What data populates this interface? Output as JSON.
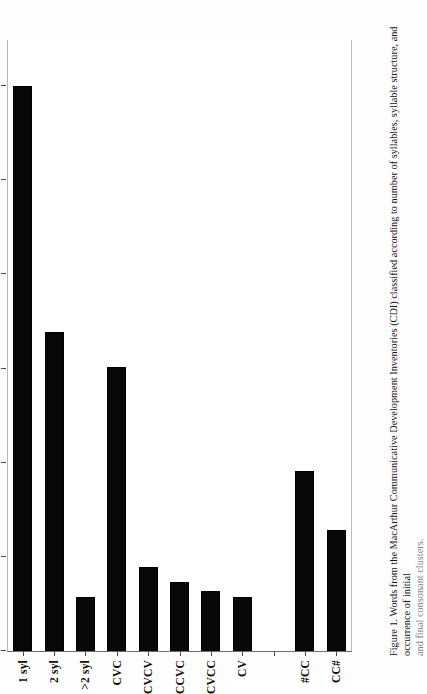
{
  "figure": {
    "caption_label": "Figure 1.",
    "caption_text": "Words from the MacArthur Communicative Development Inventories (CDI) classified according to number of syllables, syllable structure, and occurrence of initial",
    "caption_continued": "and final consonant clusters."
  },
  "chart_data": {
    "type": "bar",
    "orientation": "horizontal",
    "title": "",
    "xlabel": "%",
    "ylabel": "",
    "xlim": [
      0,
      65
    ],
    "grid": false,
    "legend": false,
    "bar_color": "#080808",
    "axis_color": "#6f6f6f",
    "ticks": [
      0,
      10,
      20,
      30,
      40,
      50,
      60
    ],
    "categories": [
      "1 syl",
      "2 syl",
      ">2 syl",
      "CVC",
      "CVCV",
      "CCVC",
      "CVCC",
      "CV",
      "",
      "#CC",
      "CC#"
    ],
    "values": [
      60.0,
      33.9,
      5.7,
      30.2,
      8.9,
      7.3,
      6.4,
      5.7,
      null,
      19.1,
      12.9
    ]
  }
}
